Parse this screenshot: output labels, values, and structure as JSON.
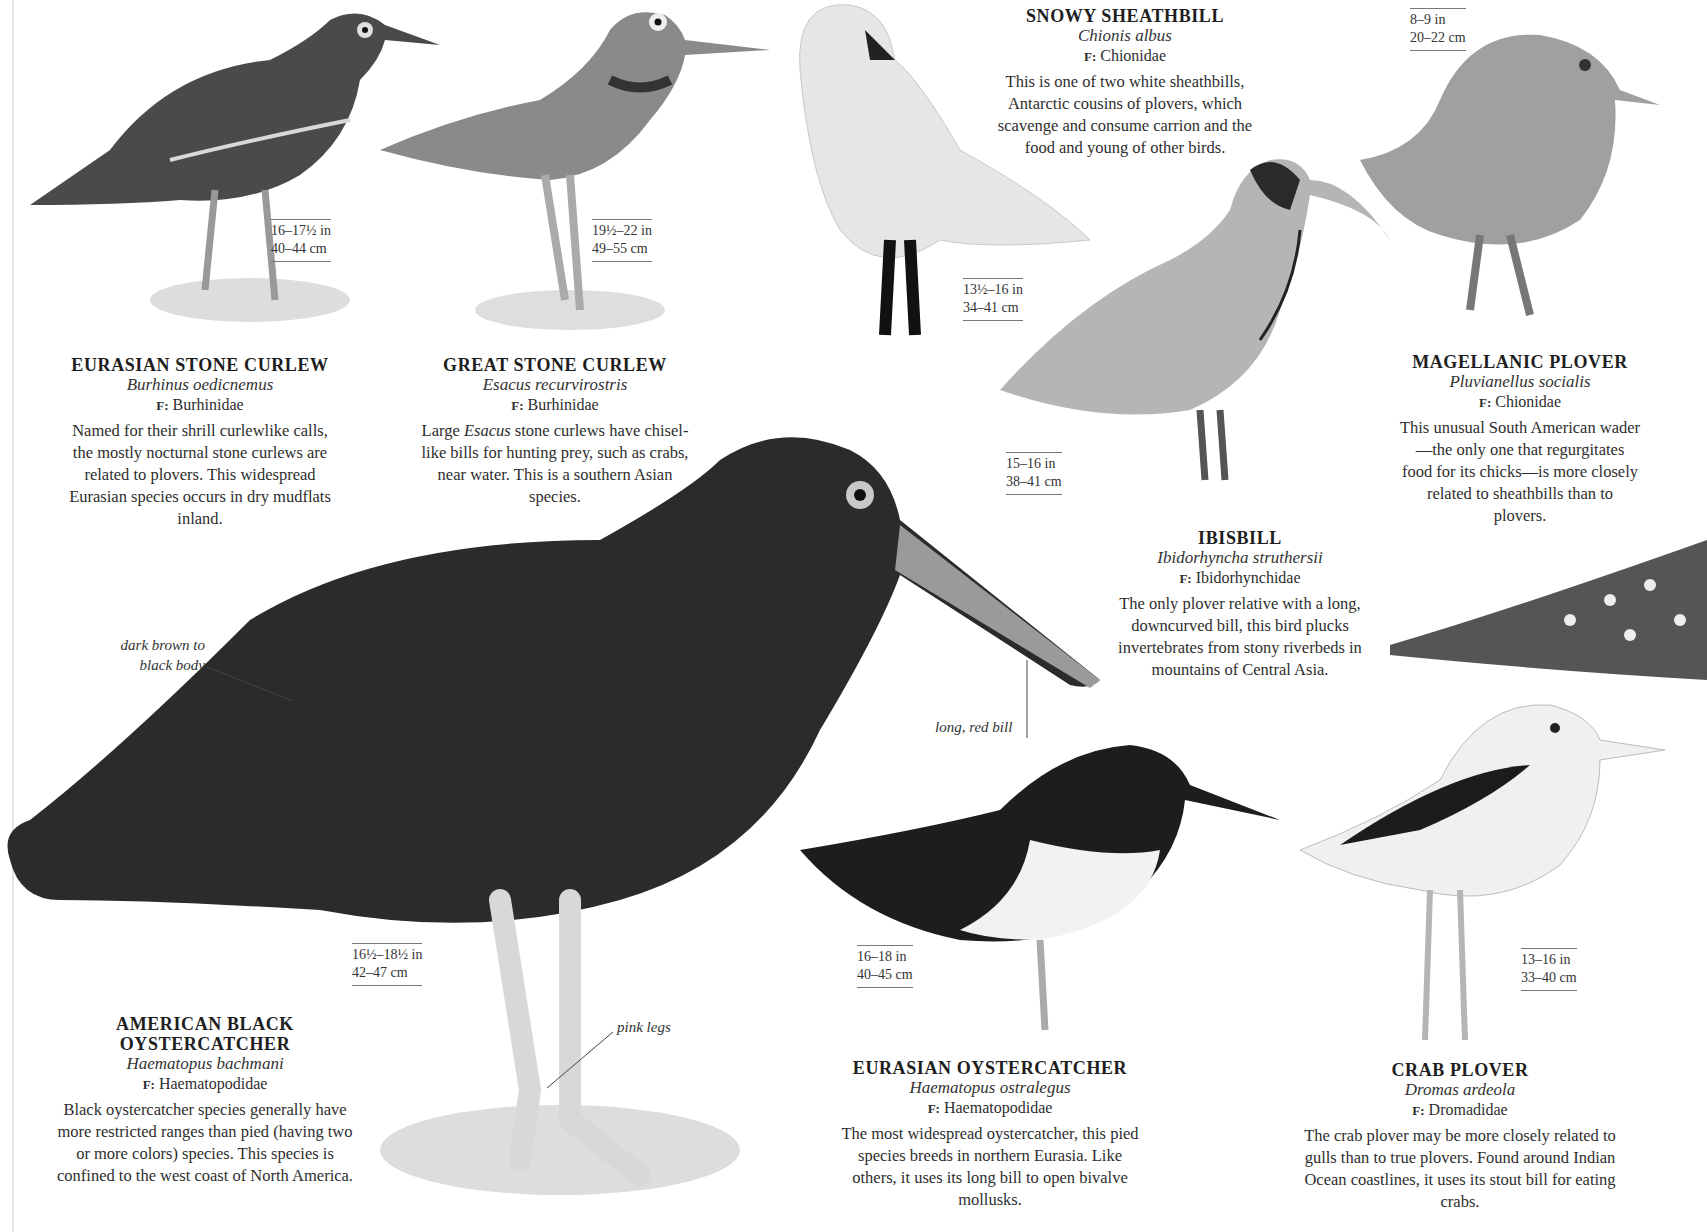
{
  "species": [
    {
      "id": "eurasian-stone-curlew",
      "name": "EURASIAN STONE CURLEW",
      "latin": "Burhinus oedicnemus",
      "family_prefix": "F:",
      "family": "Burhinidae",
      "description": "Named for their shrill curlewlike calls, the mostly nocturnal stone curlews are related to plovers. This widespread Eurasian species occurs in dry mudflats inland.",
      "size_in": "16–17½ in",
      "size_cm": "40–44 cm"
    },
    {
      "id": "great-stone-curlew",
      "name": "GREAT STONE CURLEW",
      "latin": "Esacus recurvirostris",
      "family_prefix": "F:",
      "family": "Burhinidae",
      "description_pre": "Large ",
      "description_italic": "Esacus",
      "description_post": " stone curlews have chisel-like bills for hunting prey, such as crabs, near water. This is a southern Asian species.",
      "size_in": "19½–22 in",
      "size_cm": "49–55 cm"
    },
    {
      "id": "snowy-sheathbill",
      "name": "SNOWY SHEATHBILL",
      "latin": "Chionis albus",
      "family_prefix": "F:",
      "family": "Chionidae",
      "description": "This is one of two white sheathbills, Antarctic cousins of plovers, which scavenge and consume carrion and the food and young of other birds.",
      "size_in": "13½–16 in",
      "size_cm": "34–41 cm"
    },
    {
      "id": "magellanic-plover",
      "name": "MAGELLANIC PLOVER",
      "latin": "Pluvianellus socialis",
      "family_prefix": "F:",
      "family": "Chionidae",
      "description": "This unusual South American wader—the only one that regurgitates food for its chicks—is more closely related to sheathbills than to plovers.",
      "size_in": "8–9 in",
      "size_cm": "20–22 cm"
    },
    {
      "id": "ibisbill",
      "name": "IBISBILL",
      "latin": "Ibidorhyncha struthersii",
      "family_prefix": "F:",
      "family": "Ibidorhynchidae",
      "description": "The only plover relative with a long, downcurved bill, this bird plucks invertebrates from stony riverbeds in mountains of Central Asia.",
      "size_in": "15–16 in",
      "size_cm": "38–41 cm"
    },
    {
      "id": "american-black-oystercatcher",
      "name_line1": "AMERICAN BLACK",
      "name_line2": "OYSTERCATCHER",
      "latin": "Haematopus bachmani",
      "family_prefix": "F:",
      "family": "Haematopodidae",
      "description": "Black oystercatcher species generally have more restricted ranges than pied (having two or more colors) species. This species is confined to the west coast of North America.",
      "size_in": "16½–18½ in",
      "size_cm": "42–47 cm",
      "callouts": {
        "body": "dark brown to black body",
        "body_line1": "dark brown to",
        "body_line2": "black body",
        "bill": "long, red bill",
        "legs": "pink legs"
      }
    },
    {
      "id": "eurasian-oystercatcher",
      "name": "EURASIAN OYSTERCATCHER",
      "latin": "Haematopus ostralegus",
      "family_prefix": "F:",
      "family": "Haematopodidae",
      "description": "The most widespread oystercatcher, this pied species breeds in northern Eurasia. Like others, it uses its long bill to open bivalve mollusks.",
      "size_in": "16–18 in",
      "size_cm": "40–45 cm"
    },
    {
      "id": "crab-plover",
      "name": "CRAB PLOVER",
      "latin": "Dromas ardeola",
      "family_prefix": "F:",
      "family": "Dromadidae",
      "description": "The crab plover may be more closely related to gulls than to true plovers. Found around Indian Ocean coastlines, it uses its stout bill for eating crabs.",
      "size_in": "13–16 in",
      "size_cm": "33–40 cm"
    }
  ]
}
